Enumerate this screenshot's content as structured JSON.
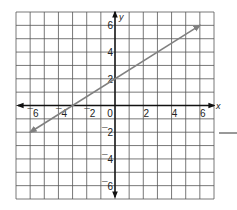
{
  "chart_data": {
    "type": "line",
    "title": "",
    "xlabel": "x",
    "ylabel": "y",
    "xlim": [
      -7,
      7
    ],
    "ylim": [
      -7,
      7
    ],
    "grid": true,
    "grid_step": 1,
    "x_ticks": [
      -6,
      -4,
      -2,
      0,
      2,
      4,
      6
    ],
    "y_ticks": [
      -6,
      -4,
      -2,
      2,
      4,
      6
    ],
    "x_tick_labels": [
      "¯6",
      "¯4",
      "¯2",
      "0",
      "2",
      "4",
      "6"
    ],
    "y_tick_labels": [
      "¯6",
      "¯4",
      "¯2",
      "2",
      "4",
      "6"
    ],
    "series": [
      {
        "name": "line",
        "equation": "y = (2/3)x + 2",
        "x": [
          -6,
          -3,
          0,
          3,
          6
        ],
        "y": [
          -2,
          0,
          2,
          4,
          6
        ],
        "arrows_both_ends": true,
        "color": "#808080"
      }
    ],
    "legend": null
  },
  "answer_blank": {
    "visible": true
  }
}
